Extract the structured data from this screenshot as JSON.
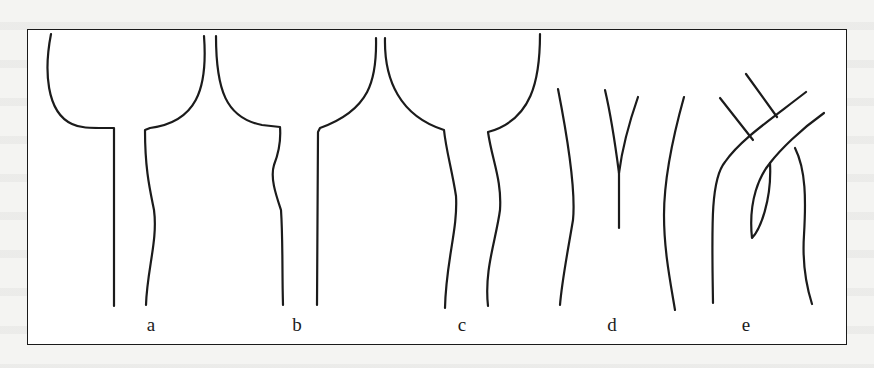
{
  "figure": {
    "panels": [
      {
        "id": "a",
        "label": "a",
        "shape": "flared-top cavity with straight narrow lower channel, squared shoulders"
      },
      {
        "id": "b",
        "label": "b",
        "shape": "two flared lobes meeting at center top, left shoulder squared, narrowing channel"
      },
      {
        "id": "c",
        "label": "c",
        "shape": "flared top with wavy (bulging) lower channel walls"
      },
      {
        "id": "d",
        "label": "d",
        "shape": "two curved walls with a Y-shaped branching line between"
      },
      {
        "id": "e",
        "label": "e",
        "shape": "crossing branched lines with an elliptical loop"
      }
    ],
    "colors": {
      "ink": "#1b1b1b",
      "paper": "#ffffff",
      "background": "#f4f4f2"
    }
  }
}
